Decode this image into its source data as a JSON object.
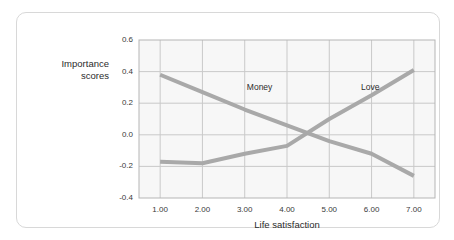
{
  "card": {
    "background": "#ffffff",
    "border_color": "#d8d8d8"
  },
  "chart_data": {
    "type": "line",
    "title": "",
    "xlabel": "Life satisfaction",
    "ylabel": "Importance scores",
    "ylabel_line1": "Importance",
    "ylabel_line2": "scores",
    "x": [
      1,
      2,
      3,
      4,
      5,
      6,
      7
    ],
    "xtick_labels": [
      "1.00",
      "2.00",
      "3.00",
      "4.00",
      "5.00",
      "6.00",
      "7.00"
    ],
    "ytick_labels": [
      "0.6",
      "0.4",
      "0.2",
      "0.0",
      "-0.2",
      "-0.4"
    ],
    "ytick_values": [
      0.6,
      0.4,
      0.2,
      0.0,
      -0.2,
      -0.4
    ],
    "xlim": [
      0.5,
      7.5
    ],
    "ylim": [
      -0.4,
      0.6
    ],
    "grid": true,
    "legend": "inline-annotations",
    "plot_background": "#f7f7f7",
    "grid_color": "#c9c9c9",
    "line_color": "#a9a9a9",
    "line_width": 4,
    "series": [
      {
        "name": "Money",
        "color": "#a9a9a9",
        "values": [
          0.38,
          0.27,
          0.16,
          0.06,
          -0.04,
          -0.12,
          -0.26
        ],
        "label_x": 3.05,
        "label_y": 0.3
      },
      {
        "name": "Love",
        "color": "#a9a9a9",
        "values": [
          -0.17,
          -0.18,
          -0.12,
          -0.07,
          0.1,
          0.25,
          0.41
        ],
        "label_x": 5.75,
        "label_y": 0.3
      }
    ]
  }
}
